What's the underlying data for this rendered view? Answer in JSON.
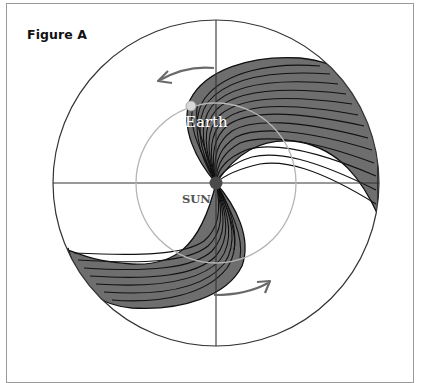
{
  "figure": {
    "title": "Figure A",
    "labels": {
      "earth": "Earth",
      "sun": "SUN"
    },
    "colors": {
      "frame": "#9a9a9a",
      "outer_circle": "#333333",
      "axes": "#333333",
      "earth_orbit": "#b5b5b5",
      "spiral_fill": "#6e6e6e",
      "spiral_lines": "#111111",
      "sun": "#4a4a4a",
      "earth": "#d8d8d8",
      "rotation_arrows": "#6a6a6a"
    },
    "elements": [
      "outer boundary circle",
      "horizontal and vertical crosshair axes",
      "Earth orbit circle",
      "Sun at center",
      "Earth on orbit",
      "two spiral arms (magnetic field lines) emanating from Sun",
      "two curved rotation arrows (counter-clockwise at top, clockwise sense at bottom)"
    ]
  }
}
